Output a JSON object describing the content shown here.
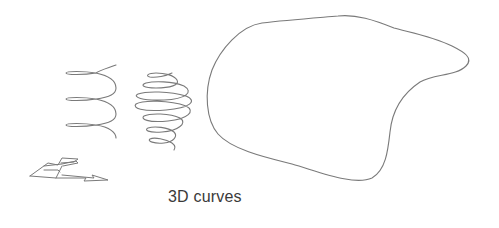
{
  "figure": {
    "caption": "3D curves",
    "stroke_color": "#777777",
    "background": "#ffffff",
    "elements": [
      {
        "name": "helix",
        "description": "cylindrical helix with three loops"
      },
      {
        "name": "spherical-spiral",
        "description": "spiral wound on a sphere, six loops"
      },
      {
        "name": "freeform-closed-curve",
        "description": "smooth closed blob-shaped curve"
      },
      {
        "name": "axes-arrow-glyph",
        "description": "3D arrow/plane icon"
      }
    ]
  }
}
